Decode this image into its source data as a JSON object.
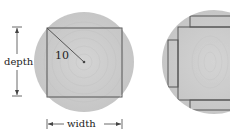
{
  "diagram": {
    "left_figure": {
      "radius_label": "10",
      "depth_label": "depth",
      "width_label": "width"
    },
    "colors": {
      "log_fill": "#c9c9c9",
      "line": "#555555",
      "text": "#222222"
    }
  }
}
